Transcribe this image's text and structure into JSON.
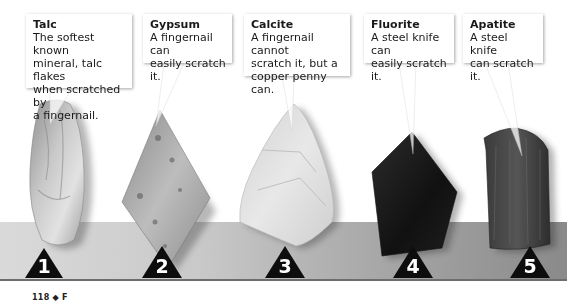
{
  "figure": {
    "minerals": [
      {
        "index": 1,
        "number_label": "1",
        "name": "Talc",
        "description": "The softest known mineral, talc flakes when scratched by a fingernail.",
        "desc_lines": [
          "The softest known",
          "mineral, talc flakes",
          "when scratched by",
          "a fingernail."
        ]
      },
      {
        "index": 2,
        "number_label": "2",
        "name": "Gypsum",
        "description": "A fingernail can easily scratch it.",
        "desc_lines": [
          "A fingernail can",
          "easily scratch it."
        ]
      },
      {
        "index": 3,
        "number_label": "3",
        "name": "Calcite",
        "description": "A fingernail cannot scratch it, but a copper penny can.",
        "desc_lines": [
          "A fingernail cannot",
          "scratch it, but a",
          "copper penny can."
        ]
      },
      {
        "index": 4,
        "number_label": "4",
        "name": "Fluorite",
        "description": "A steel knife can easily scratch it.",
        "desc_lines": [
          "A steel knife can",
          "easily scratch it."
        ]
      },
      {
        "index": 5,
        "number_label": "5",
        "name": "Apatite",
        "description": "A steel knife can scratch it.",
        "desc_lines": [
          "A steel knife",
          "can scratch it."
        ]
      }
    ],
    "marker_icon": "black-triangle-number-marker",
    "strip_colors": {
      "left": "#dadada",
      "right": "#8a8a8a"
    }
  },
  "footer": {
    "page_number": "118",
    "separator_icon": "diamond-icon",
    "separator_glyph": "◆",
    "section_letter": "F"
  }
}
